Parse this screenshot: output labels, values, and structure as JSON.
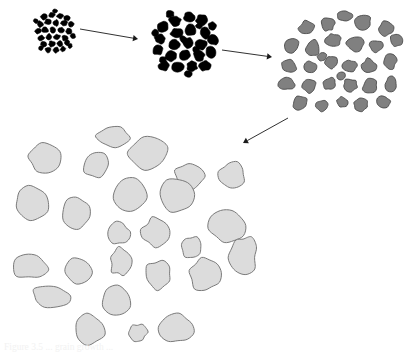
{
  "figure": {
    "background_color": "#ffffff",
    "width": 409,
    "height": 354,
    "caption_partial": "Figure 3.5 ... grain growth ..."
  },
  "palette": {
    "stage1_fill": "#000000",
    "stage1_stroke": "#000000",
    "stage2_fill": "#000000",
    "stage2_stroke": "#000000",
    "stage3_fill": "#808080",
    "stage3_stroke": "#4a4a4a",
    "stage4_fill": "#dcdcdc",
    "stage4_stroke": "#7a7a7a",
    "arrow_color": "#1a1a1a"
  },
  "stages": [
    {
      "id": "stage-1",
      "label": "Stage 1 - fine nuclei cluster",
      "fill": "#000000",
      "stroke": "#000000",
      "stroke_width": 0.6,
      "grain_count": 30,
      "grains": [
        {
          "cx": 44,
          "cy": 17,
          "rx": 3.4,
          "ry": 3.0,
          "rot": 12,
          "seed": 11
        },
        {
          "cx": 52,
          "cy": 15,
          "rx": 3.1,
          "ry": 2.8,
          "rot": 40,
          "seed": 12
        },
        {
          "cx": 60,
          "cy": 16,
          "rx": 3.3,
          "ry": 2.6,
          "rot": 70,
          "seed": 13
        },
        {
          "cx": 67,
          "cy": 18,
          "rx": 2.9,
          "ry": 2.9,
          "rot": 25,
          "seed": 14
        },
        {
          "cx": 40,
          "cy": 24,
          "rx": 3.2,
          "ry": 3.1,
          "rot": 55,
          "seed": 15
        },
        {
          "cx": 48,
          "cy": 22,
          "rx": 3.5,
          "ry": 2.8,
          "rot": 80,
          "seed": 16
        },
        {
          "cx": 56,
          "cy": 23,
          "rx": 3.0,
          "ry": 3.2,
          "rot": 15,
          "seed": 17
        },
        {
          "cx": 64,
          "cy": 23,
          "rx": 3.3,
          "ry": 2.7,
          "rot": 48,
          "seed": 18
        },
        {
          "cx": 71,
          "cy": 24,
          "rx": 2.8,
          "ry": 2.9,
          "rot": 62,
          "seed": 19
        },
        {
          "cx": 38,
          "cy": 31,
          "rx": 3.0,
          "ry": 3.0,
          "rot": 33,
          "seed": 20
        },
        {
          "cx": 45,
          "cy": 30,
          "rx": 3.4,
          "ry": 2.8,
          "rot": 71,
          "seed": 21
        },
        {
          "cx": 53,
          "cy": 30,
          "rx": 3.2,
          "ry": 3.1,
          "rot": 18,
          "seed": 22
        },
        {
          "cx": 61,
          "cy": 30,
          "rx": 3.1,
          "ry": 2.8,
          "rot": 52,
          "seed": 23
        },
        {
          "cx": 69,
          "cy": 31,
          "rx": 3.3,
          "ry": 3.0,
          "rot": 85,
          "seed": 24
        },
        {
          "cx": 41,
          "cy": 38,
          "rx": 3.2,
          "ry": 2.9,
          "rot": 27,
          "seed": 25
        },
        {
          "cx": 49,
          "cy": 37,
          "rx": 3.0,
          "ry": 3.2,
          "rot": 60,
          "seed": 26
        },
        {
          "cx": 57,
          "cy": 37,
          "rx": 3.4,
          "ry": 2.7,
          "rot": 44,
          "seed": 27
        },
        {
          "cx": 65,
          "cy": 38,
          "rx": 2.9,
          "ry": 3.0,
          "rot": 9,
          "seed": 28
        },
        {
          "cx": 44,
          "cy": 44,
          "rx": 3.1,
          "ry": 2.8,
          "rot": 75,
          "seed": 29
        },
        {
          "cx": 52,
          "cy": 44,
          "rx": 3.3,
          "ry": 3.0,
          "rot": 21,
          "seed": 30
        },
        {
          "cx": 60,
          "cy": 44,
          "rx": 3.0,
          "ry": 2.9,
          "rot": 58,
          "seed": 31
        },
        {
          "cx": 67,
          "cy": 43,
          "rx": 2.8,
          "ry": 2.7,
          "rot": 36,
          "seed": 32
        },
        {
          "cx": 48,
          "cy": 50,
          "rx": 3.0,
          "ry": 2.6,
          "rot": 66,
          "seed": 33
        },
        {
          "cx": 56,
          "cy": 50,
          "rx": 3.2,
          "ry": 2.8,
          "rot": 14,
          "seed": 34
        },
        {
          "cx": 63,
          "cy": 49,
          "rx": 2.7,
          "ry": 2.6,
          "rot": 47,
          "seed": 35
        },
        {
          "cx": 36,
          "cy": 21,
          "rx": 2.4,
          "ry": 2.3,
          "rot": 30,
          "seed": 36
        },
        {
          "cx": 73,
          "cy": 36,
          "rx": 2.5,
          "ry": 2.4,
          "rot": 50,
          "seed": 37
        },
        {
          "cx": 41,
          "cy": 48,
          "rx": 2.4,
          "ry": 2.2,
          "rot": 72,
          "seed": 38
        },
        {
          "cx": 70,
          "cy": 46,
          "rx": 2.3,
          "ry": 2.4,
          "rot": 20,
          "seed": 39
        },
        {
          "cx": 55,
          "cy": 11,
          "rx": 2.4,
          "ry": 2.2,
          "rot": 64,
          "seed": 40
        }
      ]
    },
    {
      "id": "stage-2",
      "label": "Stage 2 - coarsened dark grains",
      "fill": "#000000",
      "stroke": "#000000",
      "stroke_width": 0.6,
      "grain_count": 29,
      "grains": [
        {
          "cx": 175,
          "cy": 21,
          "rx": 6.0,
          "ry": 5.4,
          "rot": 14,
          "seed": 41
        },
        {
          "cx": 189,
          "cy": 17,
          "rx": 5.6,
          "ry": 4.8,
          "rot": 48,
          "seed": 42
        },
        {
          "cx": 202,
          "cy": 20,
          "rx": 6.2,
          "ry": 5.2,
          "rot": 73,
          "seed": 43
        },
        {
          "cx": 163,
          "cy": 27,
          "rx": 5.4,
          "ry": 5.6,
          "rot": 29,
          "seed": 44
        },
        {
          "cx": 177,
          "cy": 33,
          "rx": 6.4,
          "ry": 5.0,
          "rot": 61,
          "seed": 45
        },
        {
          "cx": 191,
          "cy": 30,
          "rx": 5.8,
          "ry": 5.6,
          "rot": 8,
          "seed": 46
        },
        {
          "cx": 205,
          "cy": 33,
          "rx": 5.2,
          "ry": 5.8,
          "rot": 52,
          "seed": 47
        },
        {
          "cx": 160,
          "cy": 39,
          "rx": 5.6,
          "ry": 5.0,
          "rot": 80,
          "seed": 48
        },
        {
          "cx": 174,
          "cy": 45,
          "rx": 6.0,
          "ry": 5.4,
          "rot": 23,
          "seed": 49
        },
        {
          "cx": 188,
          "cy": 43,
          "rx": 5.4,
          "ry": 5.8,
          "rot": 66,
          "seed": 50
        },
        {
          "cx": 201,
          "cy": 45,
          "rx": 6.2,
          "ry": 5.0,
          "rot": 37,
          "seed": 51
        },
        {
          "cx": 213,
          "cy": 40,
          "rx": 5.0,
          "ry": 5.4,
          "rot": 12,
          "seed": 52
        },
        {
          "cx": 158,
          "cy": 50,
          "rx": 5.2,
          "ry": 5.2,
          "rot": 58,
          "seed": 53
        },
        {
          "cx": 171,
          "cy": 56,
          "rx": 6.0,
          "ry": 5.2,
          "rot": 31,
          "seed": 54
        },
        {
          "cx": 185,
          "cy": 55,
          "rx": 5.6,
          "ry": 5.6,
          "rot": 74,
          "seed": 55
        },
        {
          "cx": 199,
          "cy": 56,
          "rx": 5.8,
          "ry": 5.0,
          "rot": 19,
          "seed": 56
        },
        {
          "cx": 211,
          "cy": 52,
          "rx": 5.0,
          "ry": 5.6,
          "rot": 44,
          "seed": 57
        },
        {
          "cx": 164,
          "cy": 66,
          "rx": 5.6,
          "ry": 5.0,
          "rot": 69,
          "seed": 58
        },
        {
          "cx": 178,
          "cy": 67,
          "rx": 6.2,
          "ry": 5.2,
          "rot": 26,
          "seed": 59
        },
        {
          "cx": 192,
          "cy": 66,
          "rx": 5.4,
          "ry": 5.4,
          "rot": 55,
          "seed": 60
        },
        {
          "cx": 205,
          "cy": 66,
          "rx": 5.8,
          "ry": 5.0,
          "rot": 81,
          "seed": 61
        },
        {
          "cx": 170,
          "cy": 14,
          "rx": 4.2,
          "ry": 3.6,
          "rot": 35,
          "seed": 62
        },
        {
          "cx": 212,
          "cy": 26,
          "rx": 4.0,
          "ry": 4.4,
          "rot": 63,
          "seed": 63
        },
        {
          "cx": 155,
          "cy": 33,
          "rx": 3.8,
          "ry": 4.0,
          "rot": 17,
          "seed": 64
        },
        {
          "cx": 183,
          "cy": 39,
          "rx": 3.4,
          "ry": 3.4,
          "rot": 49,
          "seed": 65
        },
        {
          "cx": 196,
          "cy": 50,
          "rx": 3.6,
          "ry": 3.2,
          "rot": 71,
          "seed": 66
        },
        {
          "cx": 163,
          "cy": 60,
          "rx": 3.4,
          "ry": 3.6,
          "rot": 24,
          "seed": 67
        },
        {
          "cx": 188,
          "cy": 74,
          "rx": 4.0,
          "ry": 3.4,
          "rot": 57,
          "seed": 68
        },
        {
          "cx": 199,
          "cy": 26,
          "rx": 3.2,
          "ry": 3.0,
          "rot": 40,
          "seed": 69
        }
      ]
    },
    {
      "id": "stage-3",
      "label": "Stage 3 - mid-gray grains, further coarsening",
      "fill": "#808080",
      "stroke": "#4a4a4a",
      "stroke_width": 0.9,
      "grain_count": 30,
      "grains": [
        {
          "cx": 307,
          "cy": 28,
          "rx": 8.0,
          "ry": 7.0,
          "rot": 16,
          "seed": 71
        },
        {
          "cx": 328,
          "cy": 24,
          "rx": 6.4,
          "ry": 6.8,
          "rot": 52,
          "seed": 72
        },
        {
          "cx": 345,
          "cy": 16,
          "rx": 7.2,
          "ry": 5.0,
          "rot": 79,
          "seed": 73
        },
        {
          "cx": 363,
          "cy": 22,
          "rx": 8.4,
          "ry": 7.6,
          "rot": 28,
          "seed": 74
        },
        {
          "cx": 386,
          "cy": 28,
          "rx": 7.0,
          "ry": 7.8,
          "rot": 64,
          "seed": 75
        },
        {
          "cx": 292,
          "cy": 45,
          "rx": 7.6,
          "ry": 7.8,
          "rot": 11,
          "seed": 76
        },
        {
          "cx": 313,
          "cy": 48,
          "rx": 7.0,
          "ry": 8.2,
          "rot": 46,
          "seed": 77
        },
        {
          "cx": 333,
          "cy": 40,
          "rx": 7.6,
          "ry": 6.4,
          "rot": 73,
          "seed": 78
        },
        {
          "cx": 355,
          "cy": 44,
          "rx": 8.2,
          "ry": 8.0,
          "rot": 22,
          "seed": 79
        },
        {
          "cx": 376,
          "cy": 46,
          "rx": 6.6,
          "ry": 6.0,
          "rot": 59,
          "seed": 80
        },
        {
          "cx": 396,
          "cy": 40,
          "rx": 6.0,
          "ry": 7.0,
          "rot": 33,
          "seed": 81
        },
        {
          "cx": 289,
          "cy": 66,
          "rx": 7.8,
          "ry": 6.2,
          "rot": 67,
          "seed": 82
        },
        {
          "cx": 310,
          "cy": 67,
          "rx": 6.8,
          "ry": 6.0,
          "rot": 18,
          "seed": 83
        },
        {
          "cx": 331,
          "cy": 62,
          "rx": 6.0,
          "ry": 6.6,
          "rot": 54,
          "seed": 84
        },
        {
          "cx": 349,
          "cy": 66,
          "rx": 7.4,
          "ry": 6.6,
          "rot": 85,
          "seed": 85
        },
        {
          "cx": 369,
          "cy": 66,
          "rx": 6.8,
          "ry": 7.4,
          "rot": 26,
          "seed": 86
        },
        {
          "cx": 390,
          "cy": 62,
          "rx": 6.4,
          "ry": 7.6,
          "rot": 61,
          "seed": 87
        },
        {
          "cx": 287,
          "cy": 84,
          "rx": 8.4,
          "ry": 6.0,
          "rot": 13,
          "seed": 88
        },
        {
          "cx": 309,
          "cy": 86,
          "rx": 7.0,
          "ry": 6.8,
          "rot": 49,
          "seed": 89
        },
        {
          "cx": 330,
          "cy": 84,
          "rx": 6.2,
          "ry": 6.2,
          "rot": 76,
          "seed": 90
        },
        {
          "cx": 350,
          "cy": 85,
          "rx": 7.0,
          "ry": 6.4,
          "rot": 21,
          "seed": 91
        },
        {
          "cx": 370,
          "cy": 86,
          "rx": 7.6,
          "ry": 7.0,
          "rot": 57,
          "seed": 92
        },
        {
          "cx": 391,
          "cy": 84,
          "rx": 6.0,
          "ry": 7.4,
          "rot": 31,
          "seed": 93
        },
        {
          "cx": 300,
          "cy": 103,
          "rx": 8.0,
          "ry": 6.6,
          "rot": 69,
          "seed": 94
        },
        {
          "cx": 322,
          "cy": 106,
          "rx": 6.4,
          "ry": 5.6,
          "rot": 15,
          "seed": 95
        },
        {
          "cx": 342,
          "cy": 102,
          "rx": 5.6,
          "ry": 5.2,
          "rot": 50,
          "seed": 96
        },
        {
          "cx": 361,
          "cy": 105,
          "rx": 7.4,
          "ry": 6.4,
          "rot": 82,
          "seed": 97
        },
        {
          "cx": 383,
          "cy": 102,
          "rx": 7.0,
          "ry": 6.0,
          "rot": 24,
          "seed": 98
        },
        {
          "cx": 322,
          "cy": 57,
          "rx": 4.6,
          "ry": 4.4,
          "rot": 43,
          "seed": 99
        },
        {
          "cx": 341,
          "cy": 76,
          "rx": 4.4,
          "ry": 4.6,
          "rot": 70,
          "seed": 100
        }
      ]
    },
    {
      "id": "stage-4",
      "label": "Stage 4 - large light-gray grains",
      "fill": "#dcdcdc",
      "stroke": "#7a7a7a",
      "stroke_width": 1.0,
      "grain_count": 25,
      "grains": [
        {
          "cx": 112,
          "cy": 137,
          "rx": 17,
          "ry": 10,
          "rot": 8,
          "seed": 111
        },
        {
          "cx": 45,
          "cy": 158,
          "rx": 17,
          "ry": 14,
          "rot": 44,
          "seed": 112
        },
        {
          "cx": 96,
          "cy": 165,
          "rx": 13,
          "ry": 14,
          "rot": 71,
          "seed": 113
        },
        {
          "cx": 148,
          "cy": 153,
          "rx": 20,
          "ry": 17,
          "rot": 19,
          "seed": 114
        },
        {
          "cx": 190,
          "cy": 177,
          "rx": 15,
          "ry": 14,
          "rot": 56,
          "seed": 115
        },
        {
          "cx": 232,
          "cy": 175,
          "rx": 13,
          "ry": 13,
          "rot": 30,
          "seed": 116
        },
        {
          "cx": 32,
          "cy": 203,
          "rx": 17,
          "ry": 16,
          "rot": 63,
          "seed": 117
        },
        {
          "cx": 77,
          "cy": 213,
          "rx": 14,
          "ry": 17,
          "rot": 12,
          "seed": 118
        },
        {
          "cx": 130,
          "cy": 195,
          "rx": 17,
          "ry": 18,
          "rot": 48,
          "seed": 119
        },
        {
          "cx": 178,
          "cy": 196,
          "rx": 18,
          "ry": 18,
          "rot": 75,
          "seed": 120
        },
        {
          "cx": 118,
          "cy": 233,
          "rx": 12,
          "ry": 11,
          "rot": 23,
          "seed": 121
        },
        {
          "cx": 156,
          "cy": 232,
          "rx": 14,
          "ry": 14,
          "rot": 59,
          "seed": 122
        },
        {
          "cx": 192,
          "cy": 248,
          "rx": 10,
          "ry": 11,
          "rot": 34,
          "seed": 123
        },
        {
          "cx": 228,
          "cy": 227,
          "rx": 18,
          "ry": 17,
          "rot": 67,
          "seed": 124
        },
        {
          "cx": 30,
          "cy": 266,
          "rx": 17,
          "ry": 13,
          "rot": 15,
          "seed": 125
        },
        {
          "cx": 77,
          "cy": 270,
          "rx": 15,
          "ry": 13,
          "rot": 52,
          "seed": 126
        },
        {
          "cx": 121,
          "cy": 262,
          "rx": 11,
          "ry": 14,
          "rot": 79,
          "seed": 127
        },
        {
          "cx": 158,
          "cy": 275,
          "rx": 14,
          "ry": 14,
          "rot": 27,
          "seed": 128
        },
        {
          "cx": 205,
          "cy": 274,
          "rx": 16,
          "ry": 17,
          "rot": 61,
          "seed": 129
        },
        {
          "cx": 51,
          "cy": 296,
          "rx": 19,
          "ry": 11,
          "rot": 36,
          "seed": 130
        },
        {
          "cx": 117,
          "cy": 300,
          "rx": 15,
          "ry": 14,
          "rot": 72,
          "seed": 131
        },
        {
          "cx": 90,
          "cy": 330,
          "rx": 16,
          "ry": 15,
          "rot": 20,
          "seed": 132
        },
        {
          "cx": 138,
          "cy": 333,
          "rx": 9,
          "ry": 9,
          "rot": 55,
          "seed": 133
        },
        {
          "cx": 176,
          "cy": 328,
          "rx": 18,
          "ry": 15,
          "rot": 83,
          "seed": 134
        },
        {
          "cx": 243,
          "cy": 255,
          "rx": 14,
          "ry": 19,
          "rot": 41,
          "seed": 135
        }
      ]
    }
  ],
  "arrows": [
    {
      "id": "arrow-1",
      "label": "arrow stage 1 to stage 2",
      "x1": 80,
      "y1": 29,
      "x2": 138,
      "y2": 39,
      "color": "#1a1a1a",
      "width": 0.9,
      "head_size": 5
    },
    {
      "id": "arrow-2",
      "label": "arrow stage 2 to stage 3",
      "x1": 222,
      "y1": 50,
      "x2": 272,
      "y2": 57,
      "color": "#1a1a1a",
      "width": 0.9,
      "head_size": 5
    },
    {
      "id": "arrow-3",
      "label": "arrow stage 3 to stage 4",
      "x1": 288,
      "y1": 118,
      "x2": 243,
      "y2": 143,
      "color": "#1a1a1a",
      "width": 0.9,
      "head_size": 5
    }
  ]
}
